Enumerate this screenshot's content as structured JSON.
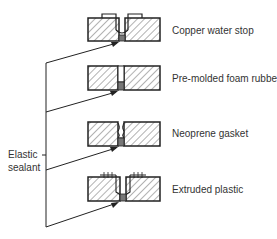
{
  "diagram": {
    "side_label": {
      "line1": "Elastic",
      "line2": "sealant"
    },
    "joints": [
      {
        "label": "Copper water stop",
        "type": "copper-water-stop"
      },
      {
        "label": "Pre-molded foam rubber",
        "type": "pre-molded-foam-rubber"
      },
      {
        "label": "Neoprene gasket",
        "type": "neoprene-gasket"
      },
      {
        "label": "Extruded plastic",
        "type": "extruded-plastic"
      }
    ],
    "colors": {
      "line": "#222222",
      "text": "#333333",
      "hatch": "#555555",
      "background": "#ffffff"
    }
  }
}
